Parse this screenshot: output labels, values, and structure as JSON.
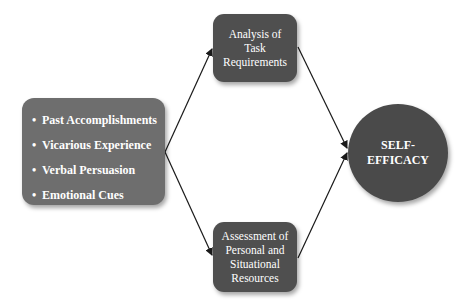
{
  "diagram": {
    "sources": {
      "items": [
        "Past Accomplishments",
        "Vicarious Experience",
        "Verbal Persuasion",
        "Emotional Cues"
      ]
    },
    "process_top": {
      "label": "Analysis of Task Requirements"
    },
    "process_bottom": {
      "label": "Assessment of Personal and Situational Resources"
    },
    "outcome": {
      "label": "SELF-EFFICACY"
    },
    "colors": {
      "sources_fill": "#6e6e6e",
      "process_fill": "#4f4f4f",
      "outcome_fill": "#4a4a4a",
      "arrow": "#1a1a1a",
      "text": "#ffffff"
    },
    "edges": [
      {
        "from": "sources",
        "to": "process_top"
      },
      {
        "from": "sources",
        "to": "process_bottom"
      },
      {
        "from": "process_top",
        "to": "outcome"
      },
      {
        "from": "process_bottom",
        "to": "outcome"
      }
    ]
  }
}
